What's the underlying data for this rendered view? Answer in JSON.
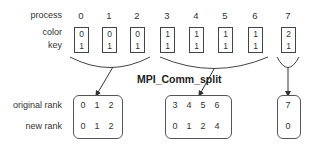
{
  "diagram": {
    "title": "MPI_Comm_split",
    "row_labels": {
      "process": "process",
      "color": "color",
      "key": "key",
      "original_rank": "original rank",
      "new_rank": "new rank"
    },
    "processes": [
      {
        "id": "0",
        "color": "0",
        "key": "1"
      },
      {
        "id": "1",
        "color": "0",
        "key": "1"
      },
      {
        "id": "2",
        "color": "0",
        "key": "1"
      },
      {
        "id": "3",
        "color": "1",
        "key": "1"
      },
      {
        "id": "4",
        "color": "1",
        "key": "1"
      },
      {
        "id": "5",
        "color": "1",
        "key": "1"
      },
      {
        "id": "6",
        "color": "1",
        "key": "1"
      },
      {
        "id": "7",
        "color": "2",
        "key": "1"
      }
    ],
    "groups": [
      {
        "color": "0",
        "original_ranks": [
          "0",
          "1",
          "2"
        ],
        "new_ranks": [
          "0",
          "1",
          "2"
        ]
      },
      {
        "color": "1",
        "original_ranks": [
          "3",
          "4",
          "5",
          "6"
        ],
        "new_ranks": [
          "0",
          "1",
          "2",
          "4"
        ]
      },
      {
        "color": "2",
        "original_ranks": [
          "7"
        ],
        "new_ranks": [
          "0"
        ]
      }
    ],
    "colors": {
      "line": "#444444",
      "text": "#333333",
      "background": "#ffffff"
    }
  }
}
